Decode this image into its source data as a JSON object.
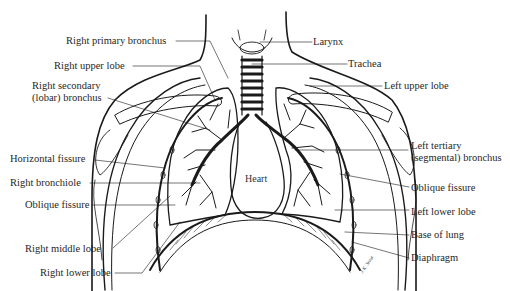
{
  "diagram": {
    "center_label": "Heart",
    "signature": "J.K. Stout",
    "labels_left": [
      {
        "id": "right-primary-bronchus",
        "text": "Right primary bronchus"
      },
      {
        "id": "right-upper-lobe",
        "text": "Right upper lobe"
      },
      {
        "id": "right-secondary-bronchus",
        "text": "Right secondary",
        "text2": "(lobar) bronchus"
      },
      {
        "id": "horizontal-fissure",
        "text": "Horizontal fissure"
      },
      {
        "id": "right-bronchiole",
        "text": "Right bronchiole"
      },
      {
        "id": "oblique-fissure-right",
        "text": "Oblique fissure"
      },
      {
        "id": "right-middle-lobe",
        "text": "Right middle lobe"
      },
      {
        "id": "right-lower-lobe",
        "text": "Right lower lobe"
      }
    ],
    "labels_right": [
      {
        "id": "larynx",
        "text": "Larynx"
      },
      {
        "id": "trachea",
        "text": "Trachea"
      },
      {
        "id": "left-upper-lobe",
        "text": "Left upper lobe"
      },
      {
        "id": "left-tertiary-bronchus",
        "text": "Left tertiary",
        "text2": "(segmental) bronchus"
      },
      {
        "id": "oblique-fissure-left",
        "text": "Oblique fissure"
      },
      {
        "id": "left-lower-lobe",
        "text": "Left lower lobe"
      },
      {
        "id": "base-of-lung",
        "text": "Base of lung"
      },
      {
        "id": "diaphragm",
        "text": "Diaphragm"
      }
    ],
    "colors": {
      "ink": "#1a1a1a",
      "background": "#ffffff"
    }
  }
}
